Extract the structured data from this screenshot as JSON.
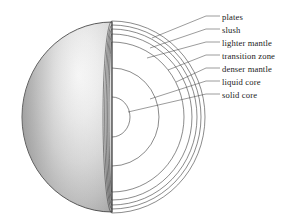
{
  "figure": {
    "kind": "cutaway-cross-section",
    "background_color": "#ffffff",
    "line_color": "#3d3d3d",
    "leader_color": "#4a4a4a",
    "text_color": "#1a1a1a",
    "sphere": {
      "center_x": 112,
      "center_y": 117,
      "radius_x": 90,
      "radius_y": 95,
      "surface_shade_light": "#f2f2f2",
      "surface_shade_mid": "#c9c9c9",
      "surface_shade_dark": "#8e8e8e"
    }
  },
  "labels": [
    {
      "id": "plates",
      "text": "plates",
      "text_x": 222,
      "text_y": 18,
      "leader_from_x": 206,
      "leader_from_y": 16,
      "anchor_x": 152,
      "anchor_y": 38
    },
    {
      "id": "slush",
      "text": "slush",
      "text_x": 222,
      "text_y": 31,
      "leader_from_x": 206,
      "leader_from_y": 29,
      "anchor_x": 150,
      "anchor_y": 48
    },
    {
      "id": "lighter-mantle",
      "text": "lighter mantle",
      "text_x": 222,
      "text_y": 44,
      "leader_from_x": 206,
      "leader_from_y": 42,
      "anchor_x": 147,
      "anchor_y": 58
    },
    {
      "id": "transition-zone",
      "text": "transition zone",
      "text_x": 222,
      "text_y": 57,
      "leader_from_x": 206,
      "leader_from_y": 55,
      "anchor_x": 168,
      "anchor_y": 70
    },
    {
      "id": "denser-mantle",
      "text": "denser mantle",
      "text_x": 222,
      "text_y": 70,
      "leader_from_x": 206,
      "leader_from_y": 68,
      "anchor_x": 176,
      "anchor_y": 82
    },
    {
      "id": "liquid-core",
      "text": "liquid core",
      "text_x": 222,
      "text_y": 83,
      "leader_from_x": 206,
      "leader_from_y": 81,
      "anchor_x": 150,
      "anchor_y": 99
    },
    {
      "id": "solid-core",
      "text": "solid core",
      "text_x": 222,
      "text_y": 96,
      "leader_from_x": 206,
      "leader_from_y": 94,
      "anchor_x": 128,
      "anchor_y": 112
    }
  ],
  "layers": [
    {
      "id": "plates",
      "name": "plates",
      "arc_radius_x": 93,
      "arc_radius_y": 96
    },
    {
      "id": "slush",
      "name": "slush",
      "arc_radius_x": 89,
      "arc_radius_y": 92
    },
    {
      "id": "lighter-mantle",
      "name": "lighter mantle",
      "arc_radius_x": 85,
      "arc_radius_y": 88
    },
    {
      "id": "transition-zone",
      "name": "transition zone",
      "arc_radius_x": 80,
      "arc_radius_y": 83
    },
    {
      "id": "denser-mantle",
      "name": "denser mantle",
      "arc_radius_x": 72,
      "arc_radius_y": 75
    },
    {
      "id": "liquid-core",
      "name": "liquid core",
      "arc_radius_x": 47,
      "arc_radius_y": 49
    },
    {
      "id": "solid-core",
      "name": "solid core",
      "arc_radius_x": 18,
      "arc_radius_y": 20
    }
  ],
  "edge_ellipses": [
    {
      "id": "edge-1",
      "rx": 9.0,
      "ry": 96
    },
    {
      "id": "edge-2",
      "rx": 7.4,
      "ry": 92
    },
    {
      "id": "edge-3",
      "rx": 5.9,
      "ry": 88
    },
    {
      "id": "edge-4",
      "rx": 4.4,
      "ry": 83
    },
    {
      "id": "edge-5",
      "rx": 3.0,
      "ry": 75
    }
  ]
}
